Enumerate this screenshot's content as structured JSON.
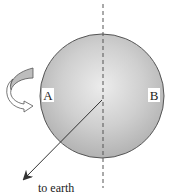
{
  "diagram": {
    "type": "planet-rotation-diagram",
    "sphere": {
      "cx": 102,
      "cy": 96,
      "r": 62,
      "fill_center": "#e6e6e6",
      "fill_edge": "#b4b4b4",
      "stroke": "#555555"
    },
    "axis": {
      "style": "dashed",
      "x": 103,
      "y1": 4,
      "y2": 188,
      "color": "#555555"
    },
    "labels": {
      "left_point": "A",
      "right_point": "B"
    },
    "earth_arrow": {
      "label": "to earth",
      "from": [
        102,
        100
      ],
      "to": [
        24,
        179
      ]
    },
    "rotation_arrow": {
      "icon": "curved-rotation-arrow-icon",
      "direction": "counterclockwise-toward-viewer"
    }
  }
}
